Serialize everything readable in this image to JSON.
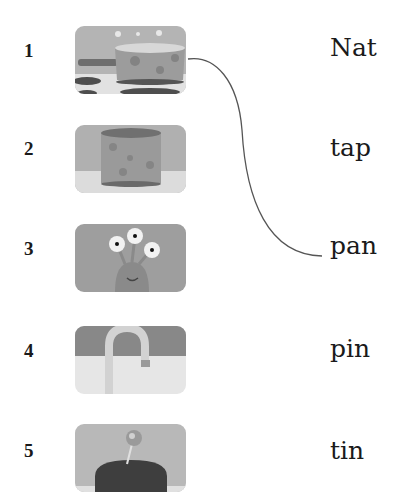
{
  "exercise": {
    "items": [
      {
        "number": "1",
        "picture": "saucepan-on-stove"
      },
      {
        "number": "2",
        "picture": "tin-can"
      },
      {
        "number": "3",
        "picture": "three-eyed-monster"
      },
      {
        "number": "4",
        "picture": "bath-tap"
      },
      {
        "number": "5",
        "picture": "pin-in-pincushion"
      }
    ],
    "words": [
      "Nat",
      "tap",
      "pan",
      "pin",
      "tin"
    ],
    "connections": [
      {
        "from_item": "1",
        "to_word": "pan"
      }
    ]
  }
}
